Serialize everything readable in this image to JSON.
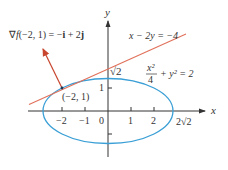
{
  "figure": {
    "axes": {
      "x_label": "x",
      "y_label": "y",
      "x_ticks": [
        "−2",
        "−1",
        "0",
        "1",
        "2"
      ],
      "y_ticks": [
        "1"
      ],
      "x_special_label": "2√2",
      "y_special_label": "√2"
    },
    "ellipse": {
      "equation_num": "x²",
      "equation_den": "4",
      "equation_rest": "+ y² = 2",
      "color": "#3a9fd6"
    },
    "tangent_line": {
      "equation": "x − 2y = −4",
      "color": "#e0705a"
    },
    "gradient": {
      "label_nabla": "∇",
      "label_f": "f",
      "label_args": "(−2, 1) = −",
      "label_i": "i",
      "label_plus": " + 2",
      "label_j": "j",
      "color": "#c8452e"
    },
    "point": {
      "label": "(−2, 1)"
    }
  }
}
